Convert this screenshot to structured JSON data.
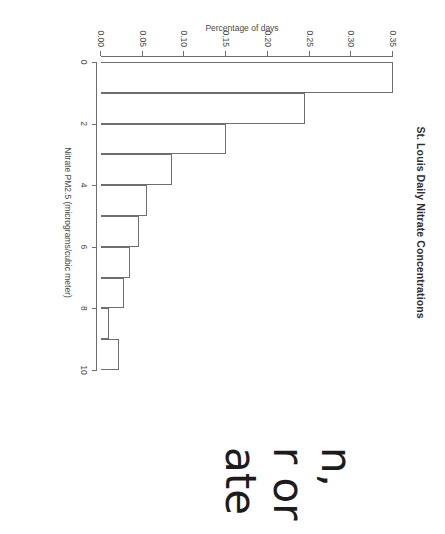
{
  "chart_data": {
    "type": "bar",
    "title": "St. Louis Daily Nitrate Concentrations",
    "subtitle": "",
    "xlabel": "Nitrate PM2.5 (micrograms/cubic meter)",
    "ylabel": "Percentage of days",
    "orientation": "rotated-90-clockwise",
    "grid": false,
    "legend": null,
    "xlim": [
      0,
      10
    ],
    "ylim": [
      0,
      0.35
    ],
    "xticks": [
      0,
      2,
      4,
      6,
      8,
      10
    ],
    "xticklabels": [
      "0",
      "2",
      "4",
      "6",
      "8",
      "10"
    ],
    "yticks": [
      0.0,
      0.05,
      0.1,
      0.15,
      0.2,
      0.25,
      0.3,
      0.35
    ],
    "yticklabels": [
      "0.00",
      "0.05",
      "0.10",
      "0.15",
      "0.20",
      "0.25",
      "0.30",
      "0.35"
    ],
    "bin_edges": [
      0,
      1,
      2,
      3,
      4,
      5,
      6,
      7,
      8,
      9,
      10
    ],
    "categories": [
      "0-1",
      "1-2",
      "2-3",
      "3-4",
      "4-5",
      "5-6",
      "6-7",
      "7-8",
      "8-9",
      "9-10"
    ],
    "values": [
      0.35,
      0.245,
      0.15,
      0.085,
      0.055,
      0.045,
      0.035,
      0.028,
      0.01,
      0.022
    ],
    "bar_color": "#ffffff",
    "bar_edge_color": "#6e6e6e"
  },
  "bottom_fragment": {
    "line1": "ate",
    "line2": "r or",
    "line3": "n,"
  }
}
